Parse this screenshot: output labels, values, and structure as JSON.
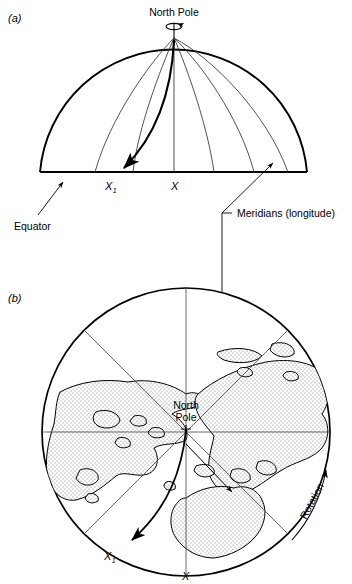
{
  "figure": {
    "type": "scientific-diagram",
    "panels": [
      {
        "id": "a",
        "label": "(a)",
        "view": "hemisphere side view",
        "labels": {
          "north_pole": "North Pole",
          "equator": "Equator",
          "meridians": "Meridians (longitude)",
          "target_origin": "X",
          "target_deflected": "X",
          "target_deflected_subscript": "1"
        }
      },
      {
        "id": "b",
        "label": "(b)",
        "view": "north polar projection",
        "labels": {
          "north_pole_line1": "North",
          "north_pole_line2": "Pole",
          "rotation": "Rotation",
          "target_origin": "X",
          "target_deflected": "X",
          "target_deflected_subscript": "1"
        }
      }
    ]
  },
  "colors": {
    "ink": "#000000",
    "background": "#ffffff",
    "land_fill": "#d9d9d9",
    "thin_line": "#333333"
  }
}
